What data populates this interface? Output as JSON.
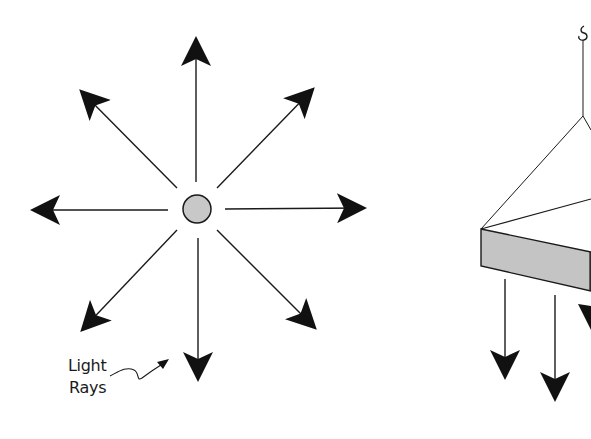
{
  "figure": {
    "left_panel": {
      "title": "Point light source",
      "label_line1": "Light",
      "label_line2": "Rays",
      "source_fill": "#c8c8c8",
      "ray_count": 8
    },
    "right_panel": {
      "title": "Hanging panel light source (cropped)",
      "panel_fill": "#c4c4c4",
      "downward_rays": 3
    },
    "colors": {
      "line": "#1a1a1a",
      "background": "#ffffff"
    }
  }
}
